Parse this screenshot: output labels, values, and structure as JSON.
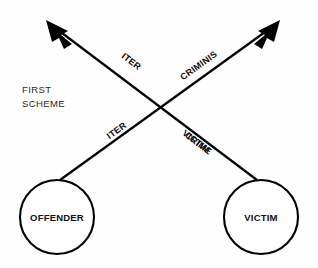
{
  "diagram": {
    "type": "crossing-arrow-scheme",
    "caption": {
      "line1": "FIRST",
      "line2": "SCHEME"
    },
    "nodes": [
      {
        "id": "offender",
        "label": "OFFENDER",
        "cx": 57,
        "cy": 217,
        "r": 37
      },
      {
        "id": "victim",
        "label": "VICTIM",
        "cx": 261,
        "cy": 217,
        "r": 37
      }
    ],
    "edges": [
      {
        "id": "offender-to-upper-right",
        "from": "offender",
        "to": "upper-right-arrow",
        "x1": 60,
        "y1": 180,
        "x2": 278,
        "y2": 22,
        "labels": [
          {
            "text": "ITER",
            "x": 117,
            "y": 131,
            "rotate": -36
          },
          {
            "text": "CRIMINIS",
            "x": 199,
            "y": 66,
            "rotate": -36
          }
        ]
      },
      {
        "id": "victim-to-upper-left",
        "from": "victim",
        "to": "upper-left-arrow",
        "x1": 257,
        "y1": 180,
        "x2": 48,
        "y2": 22,
        "labels": [
          {
            "text": "ITER",
            "x": 131,
            "y": 62,
            "rotate": 37
          },
          {
            "text": "CRIME",
            "x": 198,
            "y": 144,
            "rotate": 37
          },
          {
            "text": "VICTIM",
            "x": 196,
            "y": 142,
            "rotate": 37
          }
        ]
      }
    ],
    "arrows": [
      {
        "id": "upper-left-arrow",
        "tip_x": 48,
        "tip_y": 22,
        "angle": 217
      },
      {
        "id": "upper-right-arrow",
        "tip_x": 278,
        "tip_y": 22,
        "angle": 324
      }
    ],
    "colors": {
      "stroke": "#000000",
      "background": "#fefefe",
      "text": "#111111"
    }
  }
}
